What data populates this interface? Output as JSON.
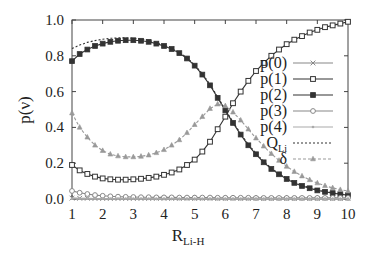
{
  "chart_data": {
    "type": "line",
    "title": "",
    "xlabel": "R_Li-H",
    "xlabel_main": "R",
    "xlabel_sub": "Li-H",
    "ylabel": "p(ν)",
    "xlim": [
      1,
      10
    ],
    "ylim": [
      0.0,
      1.0
    ],
    "x_ticks": [
      "1",
      "2",
      "3",
      "4",
      "5",
      "6",
      "7",
      "8",
      "9",
      "10"
    ],
    "y_ticks": [
      "0.0",
      "0.2",
      "0.4",
      "0.6",
      "0.8",
      "1.0"
    ],
    "grid": false,
    "legend_position": "right-middle inside",
    "x": [
      1.0,
      1.25,
      1.5,
      1.75,
      2.0,
      2.25,
      2.5,
      2.75,
      3.0,
      3.25,
      3.5,
      3.75,
      4.0,
      4.25,
      4.5,
      4.75,
      5.0,
      5.25,
      5.5,
      5.75,
      6.0,
      6.25,
      6.5,
      6.75,
      7.0,
      7.25,
      7.5,
      7.75,
      8.0,
      8.25,
      8.5,
      8.75,
      9.0,
      9.25,
      9.5,
      9.75,
      10.0
    ],
    "series": [
      {
        "name": "p(0)",
        "marker": "x",
        "color": "#888888",
        "dash": "none",
        "values": [
          0.005,
          0.004,
          0.004,
          0.003,
          0.003,
          0.003,
          0.003,
          0.003,
          0.003,
          0.003,
          0.003,
          0.003,
          0.003,
          0.003,
          0.003,
          0.003,
          0.003,
          0.003,
          0.003,
          0.003,
          0.003,
          0.003,
          0.003,
          0.003,
          0.003,
          0.003,
          0.003,
          0.003,
          0.003,
          0.003,
          0.003,
          0.003,
          0.003,
          0.003,
          0.003,
          0.003,
          0.003
        ]
      },
      {
        "name": "p(1)",
        "marker": "square",
        "color": "#333333",
        "dash": "none",
        "values": [
          0.19,
          0.16,
          0.14,
          0.125,
          0.115,
          0.11,
          0.108,
          0.108,
          0.11,
          0.113,
          0.118,
          0.125,
          0.135,
          0.148,
          0.165,
          0.19,
          0.22,
          0.265,
          0.32,
          0.39,
          0.46,
          0.535,
          0.6,
          0.66,
          0.715,
          0.76,
          0.8,
          0.835,
          0.865,
          0.89,
          0.91,
          0.93,
          0.945,
          0.96,
          0.97,
          0.98,
          0.99
        ]
      },
      {
        "name": "p(2)",
        "marker": "filled-square",
        "color": "#333333",
        "dash": "none",
        "values": [
          0.77,
          0.81,
          0.835,
          0.855,
          0.868,
          0.878,
          0.884,
          0.887,
          0.887,
          0.884,
          0.878,
          0.868,
          0.855,
          0.838,
          0.815,
          0.785,
          0.745,
          0.695,
          0.635,
          0.565,
          0.495,
          0.425,
          0.36,
          0.3,
          0.25,
          0.205,
          0.168,
          0.138,
          0.112,
          0.09,
          0.073,
          0.06,
          0.048,
          0.04,
          0.033,
          0.027,
          0.022
        ]
      },
      {
        "name": "p(3)",
        "marker": "circle",
        "color": "#888888",
        "dash": "none",
        "values": [
          0.045,
          0.035,
          0.028,
          0.022,
          0.018,
          0.015,
          0.013,
          0.012,
          0.011,
          0.01,
          0.01,
          0.009,
          0.009,
          0.009,
          0.008,
          0.008,
          0.008,
          0.008,
          0.008,
          0.007,
          0.007,
          0.007,
          0.007,
          0.007,
          0.006,
          0.006,
          0.006,
          0.006,
          0.006,
          0.006,
          0.006,
          0.006,
          0.006,
          0.006,
          0.006,
          0.006,
          0.006
        ]
      },
      {
        "name": "p(4)",
        "marker": "dot",
        "color": "#aaaaaa",
        "dash": "none",
        "values": [
          0.002,
          0.002,
          0.002,
          0.002,
          0.002,
          0.002,
          0.002,
          0.002,
          0.002,
          0.002,
          0.002,
          0.002,
          0.002,
          0.002,
          0.002,
          0.002,
          0.002,
          0.002,
          0.002,
          0.002,
          0.002,
          0.002,
          0.002,
          0.002,
          0.002,
          0.002,
          0.002,
          0.002,
          0.002,
          0.002,
          0.002,
          0.002,
          0.002,
          0.002,
          0.002,
          0.002,
          0.002
        ]
      },
      {
        "name": "Q_Li",
        "marker": "none",
        "color": "#333333",
        "dash": "2,2",
        "values": [
          0.84,
          0.86,
          0.875,
          0.885,
          0.893,
          0.898,
          0.9,
          0.9,
          0.898,
          0.893,
          0.886,
          0.875,
          0.86,
          0.842,
          0.818,
          0.79,
          0.748,
          0.7,
          0.64,
          0.57,
          0.5,
          0.43,
          0.365,
          0.305,
          0.255,
          0.21,
          0.172,
          0.142,
          0.116,
          0.094,
          0.077,
          0.063,
          0.051,
          0.043,
          0.035,
          0.029,
          0.024
        ]
      },
      {
        "name": "δ",
        "marker": "triangle",
        "color": "#999999",
        "dash": "3,2",
        "values": [
          0.48,
          0.4,
          0.345,
          0.3,
          0.27,
          0.25,
          0.24,
          0.235,
          0.235,
          0.238,
          0.245,
          0.258,
          0.275,
          0.3,
          0.33,
          0.37,
          0.415,
          0.46,
          0.505,
          0.53,
          0.52,
          0.485,
          0.44,
          0.39,
          0.34,
          0.295,
          0.253,
          0.215,
          0.182,
          0.153,
          0.128,
          0.107,
          0.089,
          0.074,
          0.062,
          0.052,
          0.044
        ]
      }
    ],
    "legend": [
      {
        "main": "p(0)",
        "sub": ""
      },
      {
        "main": "p(1)",
        "sub": ""
      },
      {
        "main": "p(2)",
        "sub": ""
      },
      {
        "main": "p(3)",
        "sub": ""
      },
      {
        "main": "p(4)",
        "sub": ""
      },
      {
        "main": "Q",
        "sub": "Li"
      },
      {
        "main": "δ",
        "sub": ""
      }
    ]
  }
}
